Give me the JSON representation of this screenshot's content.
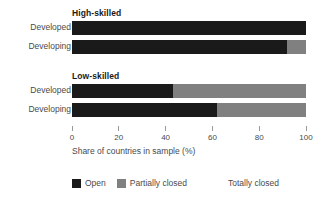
{
  "chart_data": {
    "type": "bar",
    "orientation": "horizontal",
    "stacked": true,
    "title": "",
    "xlabel": "Share of countries in sample (%)",
    "ylabel": "",
    "xlim": [
      0,
      100
    ],
    "xticks": [
      0,
      20,
      40,
      60,
      80,
      100
    ],
    "xtick_labels": [
      "0",
      "20",
      "40",
      "60",
      "80",
      "100"
    ],
    "grid": false,
    "legend_position": "bottom",
    "series": [
      {
        "name": "Open",
        "color": "#1a1a1a",
        "values": [
          100,
          92,
          43,
          62
        ]
      },
      {
        "name": "Partially closed",
        "color": "#808080",
        "values": [
          0,
          8,
          57,
          38
        ]
      },
      {
        "name": "Totally closed",
        "color": "#ffffff",
        "values": [
          0,
          0,
          0,
          0
        ]
      }
    ],
    "categories": [
      "Developed",
      "Developing",
      "Developed",
      "Developing"
    ],
    "groups": [
      {
        "title": "High-skilled",
        "rows": [
          {
            "label": "Developed",
            "open": 100,
            "partially_closed": 0,
            "totally_closed": 0
          },
          {
            "label": "Developing",
            "open": 92,
            "partially_closed": 8,
            "totally_closed": 0
          }
        ]
      },
      {
        "title": "Low-skilled",
        "rows": [
          {
            "label": "Developed",
            "open": 43,
            "partially_closed": 57,
            "totally_closed": 0
          },
          {
            "label": "Developing",
            "open": 62,
            "partially_closed": 38,
            "totally_closed": 0
          }
        ]
      }
    ]
  },
  "axis": {
    "title": "Share of countries in sample (%)",
    "ticks": [
      "0",
      "20",
      "40",
      "60",
      "80",
      "100"
    ]
  },
  "legend": {
    "items": [
      {
        "label": "Open",
        "color": "#1a1a1a"
      },
      {
        "label": "Partially closed",
        "color": "#808080"
      },
      {
        "label": "Totally closed",
        "color": "#ffffff"
      }
    ]
  },
  "colors": {
    "open": "#1a1a1a",
    "partially_closed": "#808080",
    "totally_closed": "#ffffff",
    "text": "#4a4a4a",
    "background": "#ffffff"
  }
}
